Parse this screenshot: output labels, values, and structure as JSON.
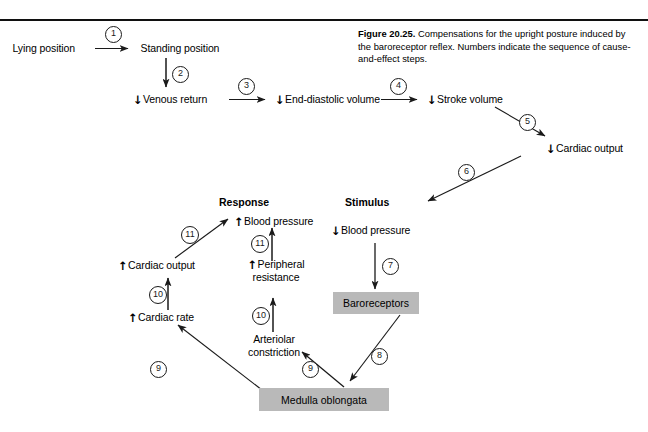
{
  "figure": {
    "label": "Figure 20.25.",
    "caption": "Compensations for the upright posture induced by the baroreceptor reflex. Numbers indicate the sequence of cause-and-effect steps.",
    "rule_color": "#101010",
    "box_fill": "#b9b9b9"
  },
  "headers": {
    "response": "Response",
    "stimulus": "Stimulus"
  },
  "nodes": {
    "lying_position": {
      "label": "Lying position",
      "arrow": ""
    },
    "standing_position": {
      "label": "Standing position",
      "arrow": ""
    },
    "venous_return": {
      "label": "Venous return",
      "arrow": "↓"
    },
    "end_diastolic_volume": {
      "label": "End-diastolic volume",
      "arrow": "↓"
    },
    "stroke_volume": {
      "label": "Stroke volume",
      "arrow": "↓"
    },
    "cardiac_output_down": {
      "label": "Cardiac output",
      "arrow": "↓"
    },
    "blood_pressure_down": {
      "label": "Blood pressure",
      "arrow": "↓"
    },
    "baroreceptors": {
      "label": "Baroreceptors"
    },
    "medulla_oblongata": {
      "label": "Medulla oblongata"
    },
    "arteriolar_constriction": {
      "label": "Arteriolar constriction",
      "arrow": ""
    },
    "peripheral_resistance": {
      "label": "Peripheral resistance",
      "arrow": "↑"
    },
    "cardiac_rate_up": {
      "label": "Cardiac rate",
      "arrow": "↑"
    },
    "cardiac_output_up": {
      "label": "Cardiac output",
      "arrow": "↑"
    },
    "blood_pressure_up": {
      "label": "Blood pressure",
      "arrow": "↑"
    }
  },
  "steps": [
    {
      "n": "1",
      "from": "lying_position",
      "to": "standing_position"
    },
    {
      "n": "2",
      "from": "standing_position",
      "to": "venous_return"
    },
    {
      "n": "3",
      "from": "venous_return",
      "to": "end_diastolic_volume"
    },
    {
      "n": "4",
      "from": "end_diastolic_volume",
      "to": "stroke_volume"
    },
    {
      "n": "5",
      "from": "stroke_volume",
      "to": "cardiac_output_down"
    },
    {
      "n": "6",
      "from": "cardiac_output_down",
      "to": "blood_pressure_down"
    },
    {
      "n": "7",
      "from": "blood_pressure_down",
      "to": "baroreceptors"
    },
    {
      "n": "8",
      "from": "baroreceptors",
      "to": "medulla_oblongata"
    },
    {
      "n": "9",
      "from": "medulla_oblongata",
      "to": "cardiac_rate_up"
    },
    {
      "n": "9",
      "from": "medulla_oblongata",
      "to": "arteriolar_constriction"
    },
    {
      "n": "10",
      "from": "cardiac_rate_up",
      "to": "cardiac_output_up"
    },
    {
      "n": "10",
      "from": "arteriolar_constriction",
      "to": "peripheral_resistance"
    },
    {
      "n": "11",
      "from": "cardiac_output_up",
      "to": "blood_pressure_up"
    },
    {
      "n": "11",
      "from": "peripheral_resistance",
      "to": "blood_pressure_up"
    }
  ]
}
